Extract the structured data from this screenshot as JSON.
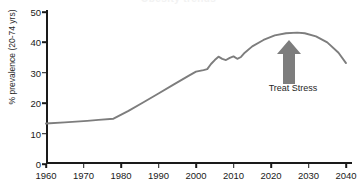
{
  "chart_data": {
    "type": "line",
    "title": "Obesity trends",
    "xlabel": "",
    "ylabel": "% prevalence (20-74 yrs)",
    "xlim": [
      1960,
      2040
    ],
    "ylim": [
      0,
      50
    ],
    "xticks": [
      1960,
      1970,
      1980,
      1990,
      2000,
      2010,
      2020,
      2030,
      2040
    ],
    "yticks": [
      0,
      10,
      20,
      30,
      40,
      50
    ],
    "grid": false,
    "legend": false,
    "line_color": "#7d7d7d",
    "series": [
      {
        "name": "% prevalence (20-74 yrs)",
        "x": [
          1960,
          1965,
          1971,
          1974,
          1978,
          1982,
          1986,
          1990,
          1994,
          1998,
          2000,
          2002,
          2003,
          2004,
          2005,
          2006,
          2007,
          2008,
          2009,
          2010,
          2011,
          2012,
          2013,
          2015,
          2018,
          2021,
          2024,
          2027,
          2029,
          2032,
          2035,
          2038,
          2040
        ],
        "values": [
          13.3,
          13.7,
          14.2,
          14.5,
          14.9,
          17.5,
          20.3,
          23.2,
          26.1,
          29.0,
          30.4,
          30.9,
          31.2,
          32.9,
          34.2,
          35.3,
          34.6,
          34.2,
          34.9,
          35.4,
          34.6,
          35.2,
          36.6,
          38.7,
          40.8,
          42.3,
          43.0,
          43.2,
          43.0,
          42.0,
          40.0,
          36.6,
          33.2
        ]
      }
    ],
    "annotations": [
      {
        "label": "Treat Stress",
        "icon": "up-arrow-icon",
        "color": "#7d7d7d",
        "x_value": 2025,
        "y_value": 40
      }
    ]
  }
}
